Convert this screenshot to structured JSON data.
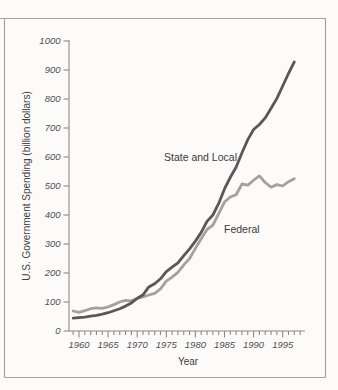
{
  "figure": {
    "y_axis_title": "U.S. Government Spending (billion dollars)",
    "x_axis_title": "Year",
    "series_labels": {
      "state_local": "State and Local",
      "federal": "Federal"
    }
  },
  "colors": {
    "state_local_line": "#5c5658",
    "federal_line": "#a6a0a1",
    "axis": "#8a8a8a",
    "frame": "#a3a3a3",
    "text": "#4f4f4f",
    "background": "#fcfbf9"
  },
  "chart_data": {
    "type": "line",
    "title": "",
    "xlabel": "Year",
    "ylabel": "U.S. Government Spending (billion dollars)",
    "ylim": [
      0,
      1000
    ],
    "xlim": [
      1958,
      1999
    ],
    "grid": false,
    "legend": "inline-labels",
    "y_ticks": [
      0,
      100,
      200,
      300,
      400,
      500,
      600,
      700,
      800,
      900,
      1000
    ],
    "x_ticks_labeled": [
      1960,
      1965,
      1970,
      1975,
      1980,
      1985,
      1990,
      1995
    ],
    "x_ticks_minor": [
      1959,
      1960,
      1961,
      1962,
      1963,
      1964,
      1965,
      1966,
      1967,
      1968,
      1969,
      1970,
      1971,
      1972,
      1973,
      1974,
      1975,
      1976,
      1977,
      1978,
      1979,
      1980,
      1981,
      1982,
      1983,
      1984,
      1985,
      1986,
      1987,
      1988,
      1989,
      1990,
      1991,
      1992,
      1993,
      1994,
      1995,
      1996,
      1997,
      1998
    ],
    "x": [
      1959,
      1960,
      1961,
      1962,
      1963,
      1964,
      1965,
      1966,
      1967,
      1968,
      1969,
      1970,
      1971,
      1972,
      1973,
      1974,
      1975,
      1976,
      1977,
      1978,
      1979,
      1980,
      1981,
      1982,
      1983,
      1984,
      1985,
      1986,
      1987,
      1988,
      1989,
      1990,
      1991,
      1992,
      1993,
      1994,
      1995,
      1996,
      1997
    ],
    "series": [
      {
        "name": "State and Local",
        "color": "#5c5658",
        "values": [
          44,
          46,
          48,
          51,
          54,
          58,
          63,
          70,
          77,
          86,
          97,
          112,
          125,
          152,
          163,
          180,
          205,
          220,
          235,
          260,
          283,
          310,
          340,
          378,
          400,
          440,
          490,
          530,
          565,
          615,
          660,
          695,
          712,
          735,
          768,
          802,
          845,
          888,
          928
        ]
      },
      {
        "name": "Federal",
        "color": "#a6a0a1",
        "values": [
          69,
          64,
          70,
          77,
          80,
          78,
          83,
          91,
          100,
          106,
          104,
          113,
          118,
          124,
          130,
          145,
          172,
          186,
          202,
          228,
          250,
          285,
          318,
          350,
          365,
          405,
          445,
          462,
          470,
          507,
          503,
          520,
          535,
          512,
          496,
          505,
          500,
          515,
          525
        ]
      }
    ]
  }
}
